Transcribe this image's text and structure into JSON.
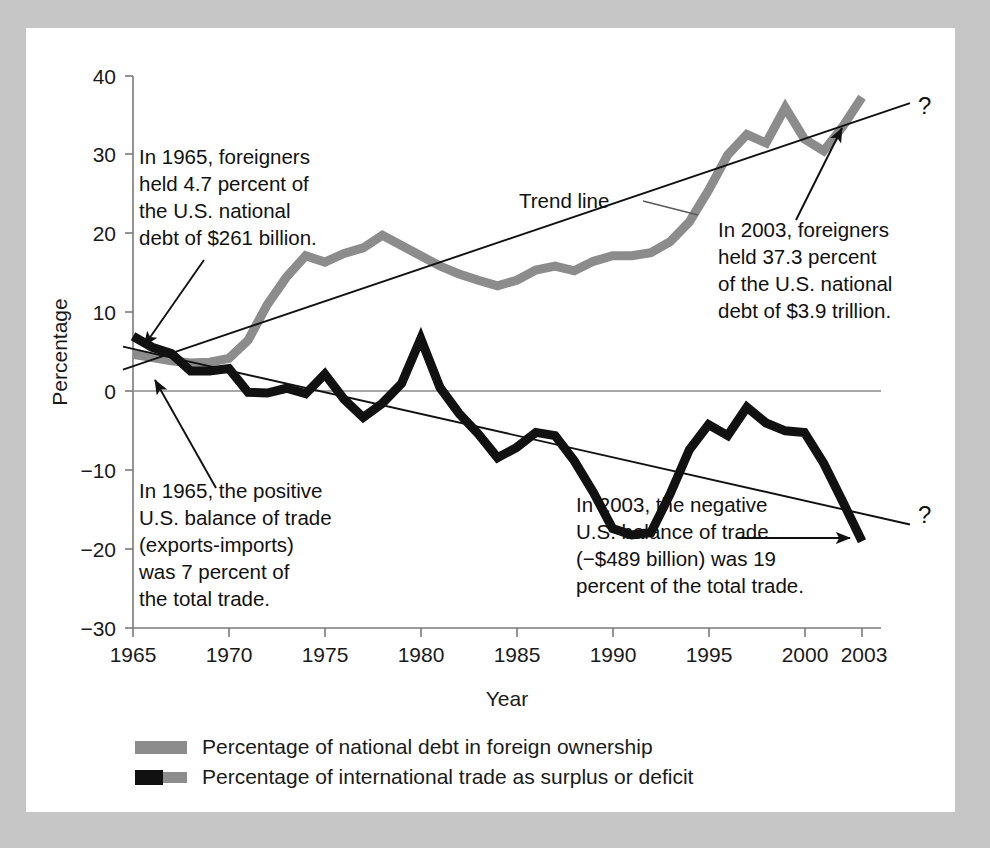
{
  "figure": {
    "background_color": "#c6c6c6",
    "panel_color": "#ffffff",
    "series_debt_color": "#8c8c8c",
    "series_trade_color": "#111111",
    "trendline_color": "#111111"
  },
  "axis": {
    "y_title": "Percentage",
    "x_title": "Year",
    "y_ticks": [
      "40",
      "30",
      "20",
      "10",
      "0",
      "−10",
      "−20",
      "−30"
    ],
    "x_ticks": [
      "1965",
      "1970",
      "1975",
      "1980",
      "1985",
      "1990",
      "1995",
      "2000",
      "2003"
    ]
  },
  "annotations": {
    "top_left": {
      "lines": [
        "In 1965, foreigners",
        "held 4.7 percent of",
        "the U.S. national",
        "debt of $261 billion."
      ]
    },
    "top_right": {
      "lines": [
        "In 2003, foreigners",
        "held 37.3 percent",
        "of the U.S. national",
        "debt of $3.9 trillion."
      ]
    },
    "bottom_left": {
      "lines": [
        "In 1965, the positive",
        "U.S. balance of trade",
        "(exports-imports)",
        "was 7 percent of",
        "the total trade."
      ]
    },
    "bottom_right": {
      "lines": [
        "In 2003, the negative",
        "U.S. balance of trade",
        "(−$489 billion) was 19",
        "percent of the total trade."
      ]
    },
    "trend_label": "Trend line",
    "question_mark_upper": "?",
    "question_mark_lower": "?"
  },
  "legend": {
    "items": [
      {
        "label": "Percentage of national debt in foreign ownership",
        "swatch": "gray"
      },
      {
        "label": "Percentage of international trade as surplus or deficit",
        "swatch": "black-gray"
      }
    ]
  },
  "chart_data": {
    "type": "line",
    "title": "",
    "xlabel": "Year",
    "ylabel": "Percentage",
    "xlim": [
      1965,
      2003
    ],
    "ylim": [
      -30,
      40
    ],
    "grid": false,
    "legend_position": "below-plot",
    "x": [
      1965,
      1966,
      1967,
      1968,
      1969,
      1970,
      1971,
      1972,
      1973,
      1974,
      1975,
      1976,
      1977,
      1978,
      1979,
      1980,
      1981,
      1982,
      1983,
      1984,
      1985,
      1986,
      1987,
      1988,
      1989,
      1990,
      1991,
      1992,
      1993,
      1994,
      1995,
      1996,
      1997,
      1998,
      1999,
      2000,
      2001,
      2002,
      2003
    ],
    "series": [
      {
        "name": "Percentage of national debt in foreign ownership",
        "color": "#8c8c8c",
        "values": [
          4.7,
          4.3,
          3.9,
          3.6,
          3.7,
          4.2,
          6.5,
          11.0,
          14.5,
          17.2,
          16.4,
          17.5,
          18.2,
          19.8,
          18.5,
          17.2,
          15.9,
          14.9,
          14.1,
          13.4,
          14.1,
          15.4,
          15.9,
          15.3,
          16.5,
          17.2,
          17.2,
          17.6,
          19.0,
          21.5,
          25.5,
          30.0,
          32.6,
          31.5,
          36.0,
          32.0,
          30.5,
          33.6,
          37.3
        ]
      },
      {
        "name": "Percentage of international trade as surplus or deficit",
        "color": "#111111",
        "values": [
          7.0,
          5.6,
          4.8,
          2.6,
          2.6,
          2.9,
          -0.1,
          -0.2,
          0.4,
          -0.3,
          2.2,
          -1.0,
          -3.3,
          -1.5,
          1.0,
          6.7,
          0.5,
          -2.8,
          -5.4,
          -8.4,
          -7.1,
          -5.2,
          -5.6,
          -8.8,
          -12.8,
          -17.4,
          -18.2,
          -17.9,
          -13.0,
          -7.4,
          -4.2,
          -5.6,
          -2.0,
          -4.0,
          -5.0,
          -5.2,
          -9.1,
          -14.0,
          -19.0
        ]
      }
    ],
    "trendlines": [
      {
        "name": "debt-trend",
        "x": [
          1965,
          2003
        ],
        "y": [
          3.2,
          34.5
        ]
      },
      {
        "name": "trade-trend",
        "x": [
          1965,
          2003
        ],
        "y": [
          5.4,
          -15.5
        ]
      }
    ]
  }
}
